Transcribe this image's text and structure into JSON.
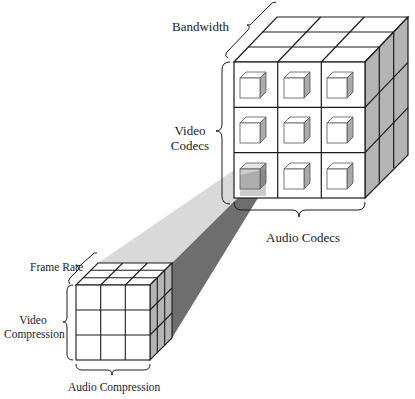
{
  "diagram": {
    "type": "nested-cube-zoom",
    "large_cube": {
      "grid": "3x3x3",
      "cell_contents": "small cube",
      "labels": {
        "top_axis": "Bandwidth",
        "left_axis": "Video Codecs",
        "left_axis_line1": "Video",
        "left_axis_line2": "Codecs",
        "bottom_axis": "Audio Codecs"
      }
    },
    "small_cube": {
      "grid": "3x3x3",
      "labels": {
        "top_axis": "Frame Rate",
        "left_axis": "Video Compression",
        "left_axis_line1": "Video",
        "left_axis_line2": "Compression",
        "bottom_axis": "Audio Compression"
      }
    },
    "zoom_beam": {
      "from": "large cube bottom-left cell",
      "to": "small cube"
    },
    "colors": {
      "line": "#1a1a1a",
      "side_face": "#b4b4b4",
      "beam_light": "#d9d9d9",
      "beam_dark": "#6e6e6e"
    }
  }
}
